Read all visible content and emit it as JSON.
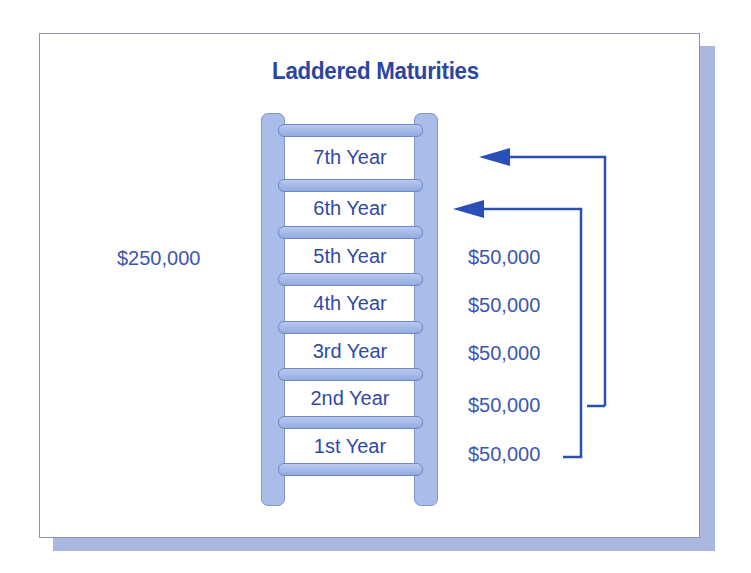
{
  "title": "Laddered Maturities",
  "total_investment": "$250,000",
  "colors": {
    "accent": "#2b45a0",
    "ladder_fill": "#a9bde8",
    "shadow": "#a9b7e0",
    "arrow": "#2b4fb8"
  },
  "ladder": {
    "steps": [
      {
        "label": "7th Year",
        "amount": ""
      },
      {
        "label": "6th Year",
        "amount": ""
      },
      {
        "label": "5th Year",
        "amount": "$50,000"
      },
      {
        "label": "4th Year",
        "amount": "$50,000"
      },
      {
        "label": "3rd Year",
        "amount": "$50,000"
      },
      {
        "label": "2nd Year",
        "amount": "$50,000"
      },
      {
        "label": "1st Year",
        "amount": "$50,000"
      }
    ]
  },
  "arrows": [
    {
      "from": "1st Year",
      "to": "6th Year",
      "icon": "arrow-left-icon"
    },
    {
      "from": "2nd Year",
      "to": "7th Year",
      "icon": "arrow-left-icon"
    }
  ]
}
